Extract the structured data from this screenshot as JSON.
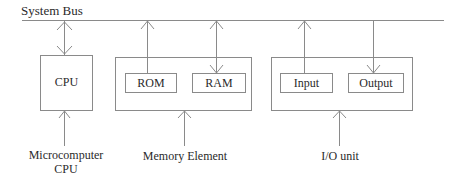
{
  "diagram": {
    "title": "System Bus",
    "blocks": {
      "cpu": {
        "label": "CPU",
        "caption_line1": "Microcomputer",
        "caption_line2": "CPU"
      },
      "memory": {
        "caption": "Memory Element",
        "rom": "ROM",
        "ram": "RAM"
      },
      "io": {
        "caption": "I/O unit",
        "input": "Input",
        "output": "Output"
      }
    },
    "connections": [
      {
        "from": "System Bus",
        "to": "CPU",
        "direction": "bidirectional"
      },
      {
        "from": "ROM",
        "to": "System Bus",
        "direction": "to-bus"
      },
      {
        "from": "System Bus",
        "to": "RAM",
        "direction": "bidirectional"
      },
      {
        "from": "Input",
        "to": "System Bus",
        "direction": "to-bus"
      },
      {
        "from": "System Bus",
        "to": "Output",
        "direction": "to-device"
      }
    ],
    "colors": {
      "line": "#8a8a8a",
      "text": "#2a2a2a",
      "background": "#ffffff"
    }
  }
}
